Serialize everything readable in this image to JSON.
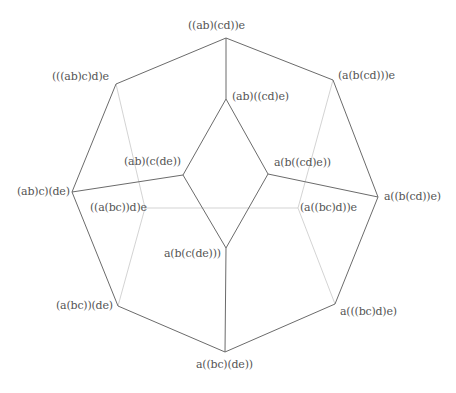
{
  "diagram": {
    "type": "associahedron-projection",
    "front_edge_color": "#6b6b6b",
    "hidden_edge_color": "#c8c8c8",
    "vertices": [
      {
        "id": "v0",
        "label": "((ab)(cd))e",
        "x": 226,
        "y": 38,
        "lx": 188,
        "ly": 20
      },
      {
        "id": "v1",
        "label": "(((ab)c)d)e",
        "x": 116,
        "y": 84,
        "lx": 52,
        "ly": 71
      },
      {
        "id": "v2",
        "label": "(a(b(cd)))e",
        "x": 333,
        "y": 80,
        "lx": 338,
        "ly": 70
      },
      {
        "id": "v3",
        "label": "(ab)c)(de)",
        "x": 72,
        "y": 192,
        "lx": 17,
        "ly": 186
      },
      {
        "id": "v4",
        "label": "a((b(cd))e)",
        "x": 378,
        "y": 197,
        "lx": 384,
        "ly": 191
      },
      {
        "id": "v5",
        "label": "(a(bc))(de)",
        "x": 118,
        "y": 306,
        "lx": 56,
        "ly": 300
      },
      {
        "id": "v6",
        "label": "a(((bc)d)e)",
        "x": 335,
        "y": 304,
        "lx": 340,
        "ly": 306
      },
      {
        "id": "v7",
        "label": "a((bc)(de))",
        "x": 225,
        "y": 352,
        "lx": 196,
        "ly": 359
      },
      {
        "id": "v8",
        "label": "(ab)((cd)e)",
        "x": 226,
        "y": 99,
        "lx": 232,
        "ly": 91
      },
      {
        "id": "v9",
        "label": "(ab)(c(de))",
        "x": 183,
        "y": 175,
        "lx": 124,
        "ly": 156
      },
      {
        "id": "v10",
        "label": "a(b((cd)e))",
        "x": 268,
        "y": 174,
        "lx": 274,
        "ly": 157
      },
      {
        "id": "v11",
        "label": "a(b(c(de)))",
        "x": 226,
        "y": 248,
        "lx": 164,
        "ly": 248
      },
      {
        "id": "v12",
        "label": "((a(bc))d)e",
        "x": 145,
        "y": 208,
        "lx": 90,
        "ly": 202
      },
      {
        "id": "v13",
        "label": "(a((bc)d))e",
        "x": 298,
        "y": 208,
        "lx": 300,
        "ly": 202
      }
    ],
    "edges": [
      {
        "from": "v0",
        "to": "v1",
        "hidden": false
      },
      {
        "from": "v0",
        "to": "v2",
        "hidden": false
      },
      {
        "from": "v0",
        "to": "v8",
        "hidden": false
      },
      {
        "from": "v1",
        "to": "v3",
        "hidden": false
      },
      {
        "from": "v2",
        "to": "v4",
        "hidden": false
      },
      {
        "from": "v3",
        "to": "v5",
        "hidden": false
      },
      {
        "from": "v4",
        "to": "v6",
        "hidden": false
      },
      {
        "from": "v5",
        "to": "v7",
        "hidden": false
      },
      {
        "from": "v6",
        "to": "v7",
        "hidden": false
      },
      {
        "from": "v8",
        "to": "v9",
        "hidden": false
      },
      {
        "from": "v8",
        "to": "v10",
        "hidden": false
      },
      {
        "from": "v9",
        "to": "v3",
        "hidden": false
      },
      {
        "from": "v10",
        "to": "v4",
        "hidden": false
      },
      {
        "from": "v9",
        "to": "v11",
        "hidden": false
      },
      {
        "from": "v10",
        "to": "v11",
        "hidden": false
      },
      {
        "from": "v11",
        "to": "v7",
        "hidden": false
      },
      {
        "from": "v1",
        "to": "v12",
        "hidden": true
      },
      {
        "from": "v12",
        "to": "v5",
        "hidden": true
      },
      {
        "from": "v12",
        "to": "v13",
        "hidden": true
      },
      {
        "from": "v2",
        "to": "v13",
        "hidden": true
      },
      {
        "from": "v13",
        "to": "v6",
        "hidden": true
      }
    ]
  }
}
